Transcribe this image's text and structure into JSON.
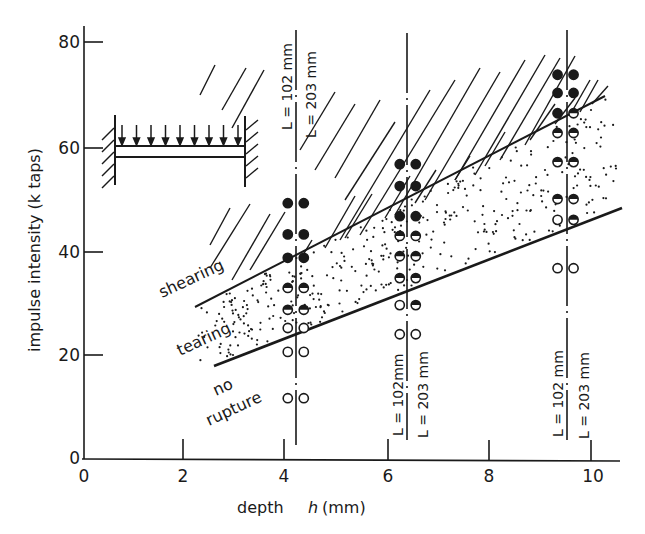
{
  "chart_data": {
    "type": "scatter",
    "title": "",
    "xlabel": "depth h (mm)",
    "ylabel": "impulse intensity (k taps)",
    "xlim": [
      0,
      10.5
    ],
    "ylim": [
      0,
      82
    ],
    "x_ticks": [
      "0",
      "2",
      "4",
      "6",
      "8",
      "10"
    ],
    "y_ticks": [
      "0",
      "20",
      "40",
      "60",
      "80"
    ],
    "grid": false,
    "legend": [
      {
        "marker": "filled-circle",
        "meaning": "shearing"
      },
      {
        "marker": "half-filled-circle",
        "meaning": "tearing"
      },
      {
        "marker": "open-circle",
        "meaning": "no rupture"
      }
    ],
    "regions": [
      {
        "label": "shearing",
        "fill": "hatched",
        "position": "above upper boundary"
      },
      {
        "label": "tearing",
        "fill": "dotted",
        "position": "between boundaries"
      },
      {
        "label": "no rupture",
        "fill": "none",
        "position": "below lower boundary"
      }
    ],
    "boundaries": [
      {
        "name": "shearing/tearing boundary",
        "x": [
          2.2,
          10.3
        ],
        "y": [
          29,
          69.5
        ]
      },
      {
        "name": "tearing/no-rupture boundary",
        "x": [
          2.6,
          10.6
        ],
        "y": [
          17.6,
          48
        ]
      }
    ],
    "columns": [
      {
        "depth_h_mm": 4.2,
        "L_left": "L = 102 mm",
        "L_right": "L = 203 mm",
        "points": [
          {
            "y": 49,
            "left": "filled",
            "right": "filled"
          },
          {
            "y": 43,
            "left": "filled",
            "right": "filled"
          },
          {
            "y": 38.5,
            "left": "filled",
            "right": "filled"
          },
          {
            "y": 32.7,
            "left": "half",
            "right": "half"
          },
          {
            "y": 28.5,
            "left": "half",
            "right": "half"
          },
          {
            "y": 25,
            "left": "open",
            "right": "open"
          },
          {
            "y": 20.4,
            "left": "open",
            "right": "open"
          },
          {
            "y": 11.5,
            "left": "open",
            "right": "open"
          }
        ]
      },
      {
        "depth_h_mm": 6.4,
        "L_left": "L = 102 mm",
        "L_right": "L = 203 mm",
        "points": [
          {
            "y": 56.5,
            "left": "filled",
            "right": "filled"
          },
          {
            "y": 52.3,
            "left": "filled",
            "right": "filled"
          },
          {
            "y": 46.5,
            "left": "filled",
            "right": "filled"
          },
          {
            "y": 42.7,
            "left": "half",
            "right": "half"
          },
          {
            "y": 38.8,
            "left": "half",
            "right": "half"
          },
          {
            "y": 34.6,
            "left": "half",
            "right": "half"
          },
          {
            "y": 29.4,
            "left": "open",
            "right": "half"
          },
          {
            "y": 23.8,
            "left": "open",
            "right": "open"
          }
        ]
      },
      {
        "depth_h_mm": 9.5,
        "L_left": "L = 102 mm",
        "L_right": "L = 203 mm",
        "points": [
          {
            "y": 73.7,
            "left": "filled",
            "right": "filled"
          },
          {
            "y": 70.2,
            "left": "filled",
            "right": "filled"
          },
          {
            "y": 66.3,
            "left": "filled",
            "right": "half"
          },
          {
            "y": 62.5,
            "left": "half",
            "right": "half"
          },
          {
            "y": 56.9,
            "left": "half",
            "right": "half"
          },
          {
            "y": 49.8,
            "left": "half",
            "right": "half"
          },
          {
            "y": 45.8,
            "left": "open",
            "right": "half"
          },
          {
            "y": 36.5,
            "left": "open",
            "right": "open"
          }
        ]
      }
    ],
    "annotations": [
      "shearing",
      "tearing",
      "no rupture",
      "clamped beam with distributed load (inset)"
    ]
  },
  "labels": {
    "y_axis_title": "impulse intensity  (k taps)",
    "x_axis_title_prefix": "depth",
    "x_axis_title_var": "h",
    "x_axis_title_unit": "(mm)",
    "region_shearing": "shearing",
    "region_tearing": "tearing",
    "region_no": "no",
    "region_rupture": "rupture",
    "L102": "L = 102 mm",
    "L203": "L = 203 mm",
    "L102_c": "L = 102mm",
    "L203_c": "L = 203 mm"
  },
  "colors": {
    "ink": "#1a1a1a",
    "background": "#ffffff"
  }
}
